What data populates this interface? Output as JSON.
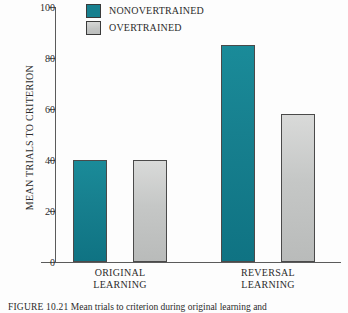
{
  "figure": {
    "caption_number": "FIGURE 10.21",
    "caption_text": "Mean trials to criterion during original learning and"
  },
  "legend": {
    "position": "top-left-inside",
    "items": [
      {
        "label": "NONOVERTRAINED",
        "color": "#17808F",
        "swatch": "legend-swatch-nonovertrained"
      },
      {
        "label": "OVERTRAINED",
        "color": "#C4C6C5",
        "swatch": "legend-swatch-overtrained"
      }
    ]
  },
  "axes": {
    "ylabel": "MEAN TRIALS TO CRITERION",
    "yticks": [
      {
        "value": 100,
        "label": "100"
      },
      {
        "value": 80,
        "label": "80"
      },
      {
        "value": 60,
        "label": "60"
      },
      {
        "value": 40,
        "label": "40"
      },
      {
        "value": 20,
        "label": "20"
      },
      {
        "value": 0,
        "label": "0"
      }
    ],
    "groups": [
      {
        "line1": "ORIGINAL",
        "line2": "LEARNING"
      },
      {
        "line1": "REVERSAL",
        "line2": "LEARNING"
      }
    ]
  },
  "chart_data": {
    "type": "bar",
    "title": "",
    "xlabel": "",
    "ylabel": "MEAN TRIALS TO CRITERION",
    "ylim": [
      0,
      100
    ],
    "ytick_step": 20,
    "grid": false,
    "legend_position": "upper left",
    "categories": [
      "ORIGINAL LEARNING",
      "REVERSAL LEARNING"
    ],
    "series": [
      {
        "name": "NONOVERTRAINED",
        "color": "#17808F",
        "values": [
          40,
          85
        ]
      },
      {
        "name": "OVERTRAINED",
        "color": "#C4C6C5",
        "values": [
          40,
          58
        ]
      }
    ]
  }
}
